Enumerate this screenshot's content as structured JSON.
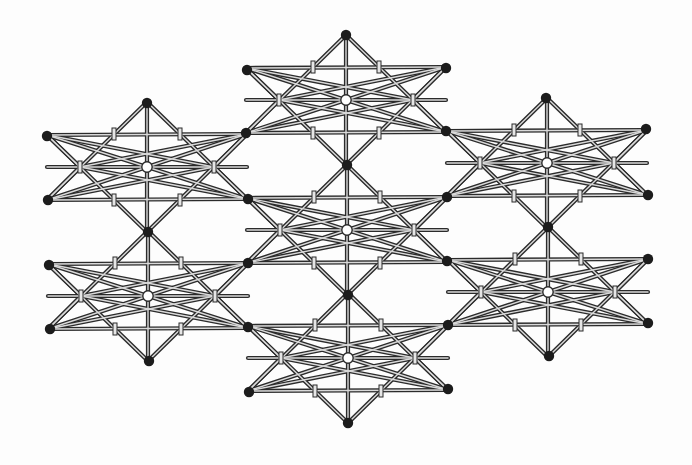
{
  "diagram": {
    "type": "space-frame lattice",
    "description": "Double-layer truss lattice composed of seven hexagonal star units, each with a hollow (white) centre node surrounded by six solid (black) nodes",
    "colors": {
      "background": "#fdfdfd",
      "member_outline": "#2b2b2b",
      "member_fill": "#d9d9d9",
      "node_solid": "#1c1c1c",
      "node_hollow": "#ffffff"
    },
    "node_radius": 5.2,
    "member_width_outer": 4.2,
    "member_width_inner": 1.4,
    "vertex_offsets": {
      "T": [
        0,
        -65
      ],
      "UR": [
        100,
        -33
      ],
      "LR": [
        100,
        32
      ],
      "B": [
        0,
        65
      ],
      "LL": [
        -100,
        33
      ],
      "UL": [
        -100,
        -32
      ],
      "C": [
        0,
        0
      ],
      "ML": [
        -67,
        0
      ],
      "MR": [
        67,
        0
      ],
      "L0": [
        -100,
        0
      ],
      "R0": [
        100,
        0
      ]
    },
    "member_template": [
      [
        "UL",
        "UR"
      ],
      [
        "LL",
        "LR"
      ],
      [
        "L0",
        "R0"
      ],
      [
        "T",
        "LL"
      ],
      [
        "T",
        "LR"
      ],
      [
        "B",
        "UL"
      ],
      [
        "B",
        "UR"
      ],
      [
        "C",
        "T"
      ],
      [
        "C",
        "B"
      ],
      [
        "C",
        "UL"
      ],
      [
        "C",
        "UR"
      ],
      [
        "C",
        "LL"
      ],
      [
        "C",
        "LR"
      ],
      [
        "UL",
        "ML"
      ],
      [
        "LL",
        "ML"
      ],
      [
        "UR",
        "MR"
      ],
      [
        "LR",
        "MR"
      ],
      [
        "UL",
        "MR"
      ],
      [
        "LL",
        "MR"
      ],
      [
        "UR",
        "ML"
      ],
      [
        "LR",
        "ML"
      ]
    ],
    "junction_offsets": [
      [
        -33,
        -33
      ],
      [
        33,
        -33
      ],
      [
        -33,
        33
      ],
      [
        33,
        33
      ],
      [
        -67,
        0
      ],
      [
        67,
        0
      ]
    ],
    "hexagon_units": [
      {
        "id": "unit-top",
        "center": [
          346,
          100
        ]
      },
      {
        "id": "unit-upper-left",
        "center": [
          147,
          167
        ]
      },
      {
        "id": "unit-upper-right",
        "center": [
          547,
          163
        ]
      },
      {
        "id": "unit-middle",
        "center": [
          347,
          230
        ]
      },
      {
        "id": "unit-lower-left",
        "center": [
          148,
          296
        ]
      },
      {
        "id": "unit-lower-right",
        "center": [
          548,
          292
        ]
      },
      {
        "id": "unit-bottom",
        "center": [
          348,
          358
        ]
      }
    ],
    "solid_nodes": [
      [
        346,
        35
      ],
      [
        247,
        70
      ],
      [
        446,
        68
      ],
      [
        147,
        103
      ],
      [
        546,
        98
      ],
      [
        47,
        136
      ],
      [
        246,
        133
      ],
      [
        446,
        131
      ],
      [
        646,
        129
      ],
      [
        347,
        165
      ],
      [
        48,
        200
      ],
      [
        248,
        199
      ],
      [
        447,
        197
      ],
      [
        648,
        195
      ],
      [
        148,
        232
      ],
      [
        548,
        227
      ],
      [
        49,
        265
      ],
      [
        248,
        263
      ],
      [
        447,
        261
      ],
      [
        648,
        259
      ],
      [
        348,
        295
      ],
      [
        50,
        329
      ],
      [
        248,
        327
      ],
      [
        448,
        325
      ],
      [
        648,
        323
      ],
      [
        149,
        361
      ],
      [
        549,
        356
      ],
      [
        249,
        392
      ],
      [
        448,
        389
      ],
      [
        348,
        423
      ]
    ],
    "hollow_nodes": [
      [
        346,
        100
      ],
      [
        147,
        167
      ],
      [
        547,
        163
      ],
      [
        347,
        230
      ],
      [
        148,
        296
      ],
      [
        548,
        292
      ],
      [
        348,
        358
      ]
    ],
    "counts": {
      "hexagon_units": 7,
      "solid_nodes": 30,
      "hollow_nodes": 7
    }
  }
}
